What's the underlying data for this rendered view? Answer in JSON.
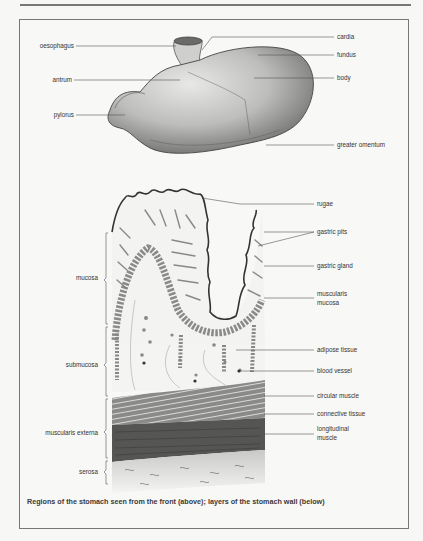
{
  "figure": {
    "caption": "Regions of the stomach seen from the front (above); layers of the stomach wall (below)",
    "stomach_labels": {
      "left": [
        "oesophagus",
        "antrum",
        "pylorus"
      ],
      "right": [
        "cardia",
        "fundus",
        "body",
        "greater omentum"
      ]
    },
    "wall_labels": {
      "left": [
        "mucosa",
        "submucosa",
        "muscularis externa",
        "serosa"
      ],
      "right": [
        "rugae",
        "gastric pits",
        "gastric gland",
        "muscularis",
        "mucosa",
        "adipose tissue",
        "blood vessel",
        "circular muscle",
        "connective tissue",
        "longitudinal",
        "muscle"
      ]
    }
  }
}
